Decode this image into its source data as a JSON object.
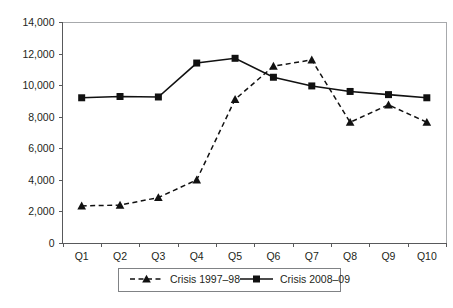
{
  "chart_data": {
    "type": "line",
    "title": "",
    "xlabel": "",
    "ylabel": "",
    "categories": [
      "Q1",
      "Q2",
      "Q3",
      "Q4",
      "Q5",
      "Q6",
      "Q7",
      "Q8",
      "Q9",
      "Q10"
    ],
    "ylim": [
      0,
      14000
    ],
    "yticks": [
      0,
      2000,
      4000,
      6000,
      8000,
      10000,
      12000,
      14000
    ],
    "ytick_labels": [
      "0",
      "2,000",
      "4,000",
      "6,000",
      "8,000",
      "10,000",
      "12,000",
      "14,000"
    ],
    "grid": false,
    "legend_position": "bottom",
    "series": [
      {
        "name": "Crisis 1997–98",
        "marker": "triangle",
        "line_style": "dashed",
        "color": "#111111",
        "values": [
          2350,
          2400,
          2880,
          4000,
          9100,
          11200,
          11600,
          7650,
          8750,
          7650
        ]
      },
      {
        "name": "Crisis 2008–09",
        "marker": "square",
        "line_style": "solid",
        "color": "#111111",
        "values": [
          9200,
          9280,
          9250,
          11400,
          11700,
          10500,
          9950,
          9600,
          9400,
          9200
        ]
      }
    ]
  },
  "legend": {
    "items": [
      {
        "label": "Crisis 1997–98"
      },
      {
        "label": "Crisis 2008–09"
      }
    ]
  },
  "axes": {
    "y_tick_labels": [
      "14,000",
      "12,000",
      "10,000",
      "8,000",
      "6,000",
      "4,000",
      "2,000",
      "0"
    ],
    "x_tick_labels": [
      "Q1",
      "Q2",
      "Q3",
      "Q4",
      "Q5",
      "Q6",
      "Q7",
      "Q8",
      "Q9",
      "Q10"
    ]
  }
}
